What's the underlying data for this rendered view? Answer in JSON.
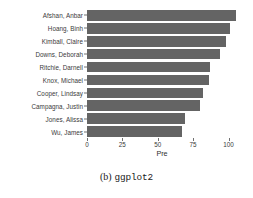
{
  "caption": {
    "index": "(b)",
    "name": "ggplot2"
  },
  "chart_data": {
    "type": "bar",
    "orientation": "horizontal",
    "title": "",
    "xlabel": "Pre",
    "ylabel": "",
    "xlim": [
      0,
      106
    ],
    "xticks": [
      0,
      25,
      50,
      75,
      100
    ],
    "xtick_labels": [
      "0",
      "25",
      "50",
      "75",
      "100"
    ],
    "grid": false,
    "legend": false,
    "bar_color": "#646464",
    "background_color": "#ffffff",
    "categories": [
      "Afshan, Anbar",
      "Hoang, Binh",
      "Kimball, Claire",
      "Downs, Deborah",
      "Ritchie, Darnell",
      "Knox, Michael",
      "Cooper, Lindsay",
      "Campagna, Justin",
      "Jones, Alissa",
      "Wu, James"
    ],
    "values": [
      105,
      101,
      98,
      94,
      87,
      86,
      82,
      80,
      69,
      67
    ]
  }
}
